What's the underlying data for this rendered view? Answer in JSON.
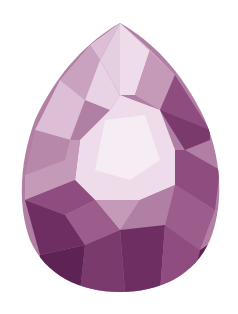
{
  "image": {
    "subject": "pear-shaped faceted gemstone",
    "description": "Illustration of a pink-purple pear (teardrop) cut gem with light pink table facet and darker plum pavilion facets on a white background",
    "background_color": "#ffffff",
    "colors": {
      "table_light": "#eedcea",
      "highlight": "#f6ecf4",
      "light_pink": "#dcbfd6",
      "mid_mauve": "#c59ab9",
      "mauve": "#b07fa3",
      "plum": "#8f4d7f",
      "dark_plum": "#6f2e62",
      "deep_plum": "#5e2354"
    }
  }
}
